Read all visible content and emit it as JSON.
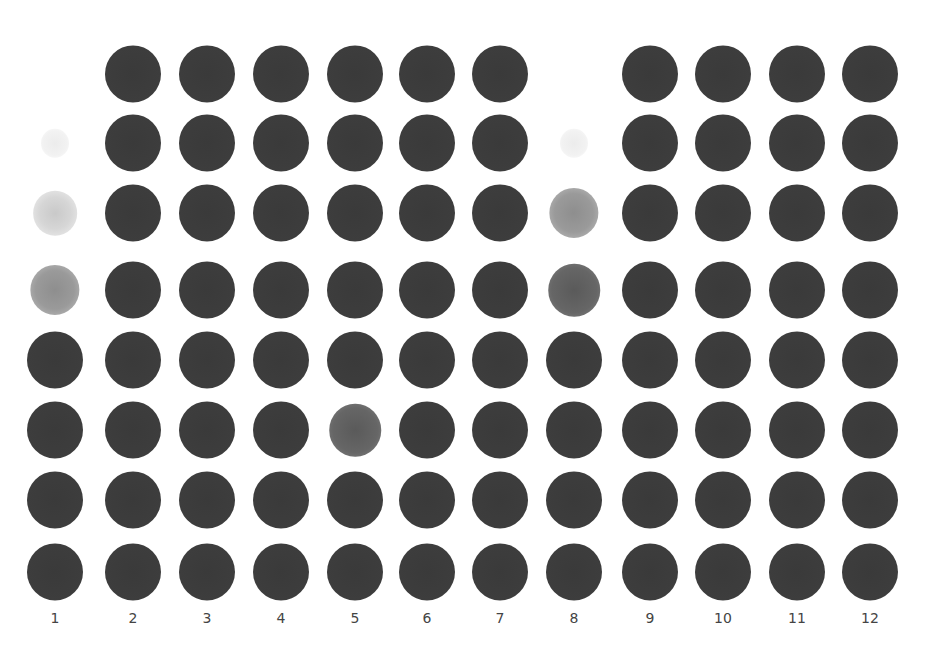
{
  "figure": {
    "type": "dot-blot",
    "rows": 8,
    "columns": 12,
    "column_labels": [
      "1",
      "2",
      "3",
      "4",
      "5",
      "6",
      "7",
      "8",
      "9",
      "10",
      "11",
      "12"
    ],
    "column_x": [
      55,
      133,
      207,
      281,
      355,
      427,
      500,
      574,
      650,
      723,
      797,
      870
    ],
    "row_y": [
      74,
      143,
      213,
      290,
      360,
      430,
      500,
      572
    ],
    "dot_diameter": 56,
    "grid": [
      [
        "none",
        "full",
        "full",
        "full",
        "full",
        "full",
        "full",
        "none",
        "full",
        "full",
        "full",
        "full"
      ],
      [
        "speck",
        "full",
        "full",
        "full",
        "full",
        "full",
        "full",
        "speck",
        "full",
        "full",
        "full",
        "full"
      ],
      [
        "trace",
        "full",
        "full",
        "full",
        "full",
        "full",
        "full",
        "faint",
        "full",
        "full",
        "full",
        "full"
      ],
      [
        "faint",
        "full",
        "full",
        "full",
        "full",
        "full",
        "full",
        "medium",
        "full",
        "full",
        "full",
        "full"
      ],
      [
        "full",
        "full",
        "full",
        "full",
        "full",
        "full",
        "full",
        "full",
        "full",
        "full",
        "full",
        "full"
      ],
      [
        "full",
        "full",
        "full",
        "full",
        "medium",
        "full",
        "full",
        "full",
        "full",
        "full",
        "full",
        "full"
      ],
      [
        "full",
        "full",
        "full",
        "full",
        "full",
        "full",
        "full",
        "full",
        "full",
        "full",
        "full",
        "full"
      ],
      [
        "full",
        "full",
        "full",
        "full",
        "full",
        "full",
        "full",
        "full",
        "full",
        "full",
        "full",
        "full"
      ]
    ],
    "colors": {
      "background": "#ffffff",
      "dot_full": "#3d3d3d",
      "dot_medium": "#666666",
      "dot_faint": "#9a9a9a",
      "label": "#444444"
    }
  }
}
